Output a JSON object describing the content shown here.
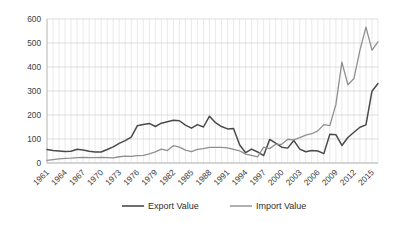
{
  "chart_data": {
    "type": "line",
    "title": "",
    "subtitle": "",
    "xlabel": "",
    "ylabel": "",
    "ylim": [
      0,
      600
    ],
    "y_ticks": [
      0,
      100,
      200,
      300,
      400,
      500,
      600
    ],
    "grid": true,
    "legend_position": "bottom",
    "x": [
      1961,
      1962,
      1963,
      1964,
      1965,
      1966,
      1967,
      1968,
      1969,
      1970,
      1971,
      1972,
      1973,
      1974,
      1975,
      1976,
      1977,
      1978,
      1979,
      1980,
      1981,
      1982,
      1983,
      1984,
      1985,
      1986,
      1987,
      1988,
      1989,
      1990,
      1991,
      1992,
      1993,
      1994,
      1995,
      1996,
      1997,
      1998,
      1999,
      2000,
      2001,
      2002,
      2003,
      2004,
      2005,
      2006,
      2007,
      2008,
      2009,
      2010,
      2011,
      2012,
      2013,
      2014,
      2015,
      2016
    ],
    "x_tick_labels": [
      "1961",
      "1964",
      "1967",
      "1970",
      "1973",
      "1976",
      "1979",
      "1982",
      "1985",
      "1988",
      "1991",
      "1994",
      "1997",
      "2000",
      "2003",
      "2006",
      "2009",
      "2012",
      "2015"
    ],
    "series": [
      {
        "name": "Export Value",
        "color": "#4a4a4a",
        "values": [
          56,
          52,
          50,
          48,
          49,
          57,
          54,
          49,
          46,
          46,
          56,
          67,
          82,
          93,
          108,
          155,
          160,
          165,
          152,
          166,
          172,
          178,
          176,
          158,
          145,
          160,
          150,
          195,
          168,
          152,
          142,
          144,
          76,
          43,
          58,
          46,
          31,
          98,
          83,
          66,
          62,
          94,
          58,
          47,
          52,
          50,
          39,
          120,
          118,
          73,
          106,
          128,
          149,
          159,
          299,
          331
        ]
      },
      {
        "name": "Import Value",
        "color": "#8f8f8f",
        "values": [
          11,
          14,
          17,
          19,
          20,
          22,
          23,
          22,
          22,
          23,
          22,
          21,
          26,
          29,
          28,
          31,
          32,
          38,
          46,
          58,
          52,
          72,
          66,
          54,
          47,
          57,
          60,
          65,
          65,
          65,
          63,
          57,
          51,
          37,
          32,
          26,
          66,
          60,
          78,
          78,
          99,
          96,
          106,
          116,
          122,
          134,
          160,
          156,
          243,
          420,
          326,
          352,
          470,
          566,
          470,
          505
        ]
      }
    ]
  },
  "legend": {
    "entries": [
      {
        "label": "Export Value"
      },
      {
        "label": "Import Value"
      }
    ]
  },
  "axes": {
    "y_tick_labels": [
      "600",
      "500",
      "400",
      "300",
      "200",
      "100",
      "0"
    ]
  },
  "colors": {
    "export_series": "#4a4a4a",
    "import_series": "#8f8f8f",
    "grid": "#c9c9c9",
    "text": "#3d3d3d",
    "background": "#ffffff"
  }
}
